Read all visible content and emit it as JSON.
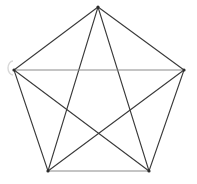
{
  "figure": {
    "canvas": {
      "width": 197,
      "height": 184,
      "background": "#ffffff"
    },
    "style": {
      "edge_color": "#3a3a3a",
      "edge_color_light": "#8a8a8a",
      "edge_width": 1.1,
      "vertex_color": "#2b2b2b",
      "vertex_radius": 1.6,
      "artifact_color": "#d8d8d8"
    }
  },
  "chart_data": {
    "type": "diagram",
    "graph_name": "K5",
    "vertex_count": 5,
    "edge_count": 10,
    "vertices": [
      {
        "id": "top",
        "label": "A",
        "x": 98,
        "y": 7
      },
      {
        "id": "right",
        "label": "B",
        "x": 184,
        "y": 70
      },
      {
        "id": "bottom-right",
        "label": "C",
        "x": 149,
        "y": 171
      },
      {
        "id": "bottom-left",
        "label": "D",
        "x": 48,
        "y": 171
      },
      {
        "id": "left",
        "label": "E",
        "x": 14,
        "y": 70
      }
    ],
    "edges": [
      {
        "from": "top",
        "to": "right",
        "kind": "perimeter",
        "color": "#3a3a3a"
      },
      {
        "from": "right",
        "to": "bottom-right",
        "kind": "perimeter",
        "color": "#3a3a3a"
      },
      {
        "from": "bottom-right",
        "to": "bottom-left",
        "kind": "perimeter",
        "color": "#8a8a8a"
      },
      {
        "from": "bottom-left",
        "to": "left",
        "kind": "perimeter",
        "color": "#3a3a3a"
      },
      {
        "from": "left",
        "to": "top",
        "kind": "perimeter",
        "color": "#3a3a3a"
      },
      {
        "from": "top",
        "to": "bottom-right",
        "kind": "diagonal",
        "color": "#3a3a3a"
      },
      {
        "from": "top",
        "to": "bottom-left",
        "kind": "diagonal",
        "color": "#3a3a3a"
      },
      {
        "from": "right",
        "to": "bottom-left",
        "kind": "diagonal",
        "color": "#3a3a3a"
      },
      {
        "from": "right",
        "to": "left",
        "kind": "diagonal",
        "color": "#8a8a8a"
      },
      {
        "from": "bottom-right",
        "to": "left",
        "kind": "diagonal",
        "color": "#3a3a3a"
      }
    ],
    "artifact": {
      "description": "faint light-gray arc near left vertex",
      "cx": 8,
      "cy": 68,
      "rx": 5,
      "ry": 7
    }
  }
}
